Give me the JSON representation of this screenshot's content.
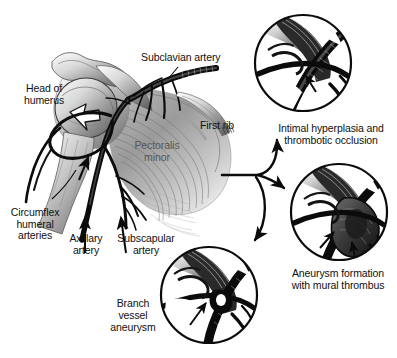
{
  "figure": {
    "background_color": "#ffffff",
    "ink_color": "#101010",
    "muscle_label_color": "#575757",
    "width": 397,
    "height": 358
  },
  "anatomy_labels": [
    {
      "id": "head-of-humerus",
      "text": "Head of\nhumerus"
    },
    {
      "id": "subclavian-artery",
      "text": "Subclavian artery"
    },
    {
      "id": "first-rib",
      "text": "First rib"
    },
    {
      "id": "pectoralis-minor",
      "text": "Pectoralis\nminor"
    },
    {
      "id": "circumflex-humeral",
      "text": "Circumflex\nhumeral\narteries"
    },
    {
      "id": "axillary-artery",
      "text": "Axillary\nartery"
    },
    {
      "id": "subscapular-artery",
      "text": "Subscapular\nartery"
    }
  ],
  "insets": [
    {
      "id": "intimal-hyperplasia",
      "caption": "Intimal hyperplasia and\nthrombotic occlusion",
      "position": "top-right",
      "arrow_count": 1
    },
    {
      "id": "aneurysm-mural-thrombus",
      "caption": "Aneurysm formation\nwith mural thrombus",
      "position": "middle-right",
      "arrow_count": 2
    },
    {
      "id": "branch-vessel-aneurysm",
      "caption": "Branch\nvessel\naneurysm",
      "position": "bottom-center",
      "arrow_count": 1
    }
  ]
}
